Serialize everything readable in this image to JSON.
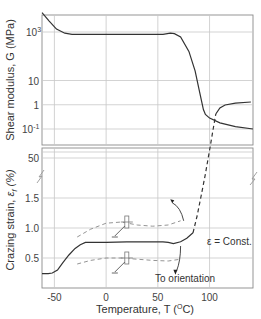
{
  "chart_data": [
    {
      "type": "line",
      "panel": "top",
      "title": "",
      "xlabel": "",
      "ylabel": "Shear modulus, G (MPa)",
      "yscale": "log",
      "xlim": [
        -62,
        142
      ],
      "ylim_log10": [
        -1.6,
        4.0
      ],
      "y_ticks": [
        {
          "value_log10": 3,
          "label": "10",
          "sup": "3"
        },
        {
          "value_log10": 1,
          "label": "10",
          "sup": ""
        },
        {
          "value_log10": 0,
          "label": "1",
          "sup": ""
        },
        {
          "value_log10": -1,
          "label": "10",
          "sup": "-1"
        }
      ],
      "x_grid": [
        -50,
        0,
        50,
        100
      ],
      "grid": true,
      "series": [
        {
          "name": "G",
          "style": "solid",
          "x": [
            -62,
            -55,
            -48,
            -40,
            -33,
            -20,
            0,
            20,
            40,
            55,
            62,
            66,
            72,
            80,
            86,
            90,
            92,
            94,
            96,
            100,
            110,
            125,
            142
          ],
          "y_log10": [
            3.8,
            3.45,
            3.12,
            2.95,
            2.9,
            2.9,
            2.9,
            2.9,
            2.9,
            2.9,
            2.95,
            2.93,
            2.8,
            2.2,
            1.4,
            0.6,
            0.2,
            -0.2,
            -0.4,
            -0.55,
            -0.75,
            -0.9,
            -1.0
          ]
        }
      ]
    },
    {
      "type": "line",
      "panel": "bottom",
      "title": "",
      "xlabel": "Temperature, T  (°C)",
      "xlabel_parts": {
        "main": "Temperature, T  (",
        "sup": "O",
        "end": "C)"
      },
      "ylabel": "Crazing strain, ε f (%)",
      "ylabel_parts": {
        "main": "Crazing strain, ",
        "eps": "ε",
        "sub": "f",
        "paren": "(%)"
      },
      "xlim": [
        -62,
        142
      ],
      "x_ticks": [
        -50,
        0,
        50,
        100
      ],
      "y_ticks": [
        {
          "value": 0.5,
          "label": "0.5"
        },
        {
          "value": 1.0,
          "label": "1.0"
        },
        {
          "value": 1.5,
          "label": "1.5"
        },
        {
          "value": 50,
          "label": "50",
          "broken_axis": true
        }
      ],
      "grid": true,
      "annotations": [
        "ε = Const.",
        "To orientation"
      ],
      "series": [
        {
          "name": "crazing strain",
          "style": "solid",
          "x": [
            -62,
            -56,
            -52,
            -47,
            -42,
            -36,
            -30,
            -25,
            -20,
            -10,
            0,
            20,
            40,
            55,
            60,
            65,
            72,
            78,
            84
          ],
          "y": [
            0.24,
            0.24,
            0.25,
            0.3,
            0.42,
            0.55,
            0.66,
            0.72,
            0.76,
            0.76,
            0.76,
            0.77,
            0.77,
            0.77,
            0.76,
            0.74,
            0.77,
            0.83,
            0.92
          ]
        },
        {
          "name": "crazing strain (transition)",
          "style": "dashed",
          "note": "crosses broken axis from ~0.92% to ~45%",
          "x": [
            84,
            88,
            92,
            96,
            100,
            104,
            106
          ],
          "y_display": [
            0.92,
            1.2,
            1.55,
            1.9,
            2.3,
            2.7,
            2.9
          ]
        },
        {
          "name": "crazing strain (high)",
          "style": "solid",
          "x": [
            106,
            110,
            115,
            125,
            140
          ],
          "y_display": [
            2.9,
            3.0,
            3.05,
            3.08,
            3.1
          ]
        },
        {
          "name": "upper specimen trend",
          "style": "dashed-ghost",
          "x": [
            -28,
            -15,
            0,
            15,
            30,
            45,
            60,
            72
          ],
          "y": [
            0.85,
            0.98,
            1.08,
            1.1,
            1.05,
            1.03,
            1.05,
            1.12
          ]
        },
        {
          "name": "lower specimen trend",
          "style": "dashed-ghost",
          "x": [
            -28,
            -15,
            0,
            15,
            30,
            45,
            60,
            72
          ],
          "y": [
            0.4,
            0.46,
            0.5,
            0.5,
            0.48,
            0.46,
            0.45,
            0.48
          ]
        }
      ]
    }
  ]
}
